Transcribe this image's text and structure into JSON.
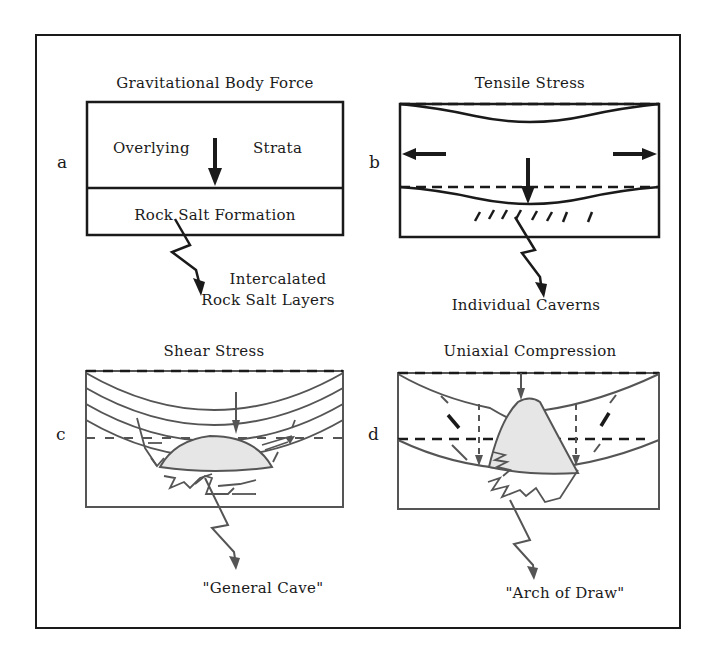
{
  "figure": {
    "panels": [
      {
        "id": "a",
        "title": "Gravitational Body Force",
        "labels": {
          "upper_left": "Overlying",
          "upper_right": "Strata",
          "lower": "Rock Salt Formation",
          "callout_line1": "Intercalated",
          "callout_line2": "Rock Salt Layers"
        }
      },
      {
        "id": "b",
        "title": "Tensile Stress",
        "labels": {
          "callout": "Individual Caverns"
        }
      },
      {
        "id": "c",
        "title": "Shear Stress",
        "labels": {
          "callout": "\"General Cave\""
        }
      },
      {
        "id": "d",
        "title": "Uniaxial Compression",
        "labels": {
          "callout": "\"Arch of Draw\""
        }
      }
    ],
    "colors": {
      "ink": "#1a1a1a",
      "soft_ink": "#555555",
      "fill": "#e6e6e6",
      "background": "#ffffff"
    }
  }
}
